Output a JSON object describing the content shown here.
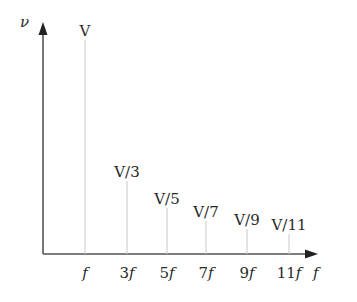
{
  "chart_data": {
    "type": "bar",
    "subtype": "stem / line spectrum",
    "title": "",
    "xlabel": "f",
    "ylabel": "ν",
    "categories": [
      "f",
      "3f",
      "5f",
      "7f",
      "9f",
      "11f"
    ],
    "harmonics": [
      1,
      3,
      5,
      7,
      9,
      11
    ],
    "values": [
      1,
      0.3333,
      0.2,
      0.1429,
      0.1111,
      0.0909
    ],
    "value_labels": [
      "V",
      "V/3",
      "V/5",
      "V/7",
      "V/9",
      "V/11"
    ],
    "value_unit_note": "amplitudes expressed as fractions of V",
    "ylim": [
      0,
      1
    ],
    "grid": false,
    "legend": null
  },
  "axes": {
    "y_label": "ν",
    "x_label": "f",
    "colors": {
      "axis": "#555555",
      "stem": "#c8c8c8",
      "text": "#2a2a2a"
    }
  }
}
